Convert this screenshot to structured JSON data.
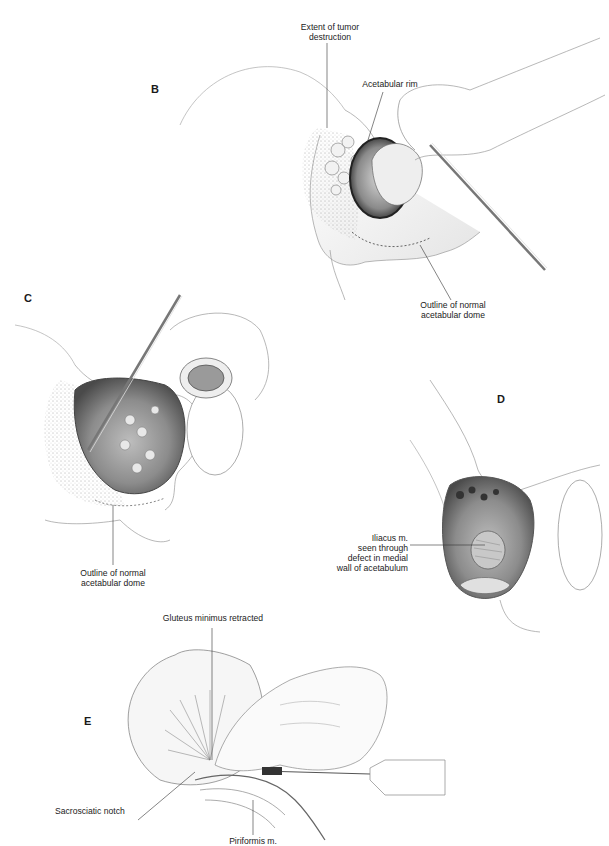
{
  "figure": {
    "panels": [
      {
        "id": "B",
        "letter": "B",
        "labels": {
          "tumor_extent_1": "Extent of tumor",
          "tumor_extent_2": "destruction",
          "rim": "Acetabular rim",
          "dome_1": "Outline of normal",
          "dome_2": "acetabular dome"
        }
      },
      {
        "id": "C",
        "letter": "C",
        "labels": {
          "dome_1": "Outline of normal",
          "dome_2": "acetabular dome"
        }
      },
      {
        "id": "D",
        "letter": "D",
        "labels": {
          "iliacus_1": "Iliacus m.",
          "iliacus_2": "seen through",
          "iliacus_3": "defect in medial",
          "iliacus_4": "wall of acetabulum"
        }
      },
      {
        "id": "E",
        "letter": "E",
        "labels": {
          "gluteus": "Gluteus minimus retracted",
          "notch": "Sacrosciatic notch",
          "piriformis": "Piriformis m."
        }
      }
    ],
    "colors": {
      "ink": "#1a1a1a",
      "line": "#555555",
      "shade": "#9a9a9a",
      "dark": "#3a3a3a"
    }
  }
}
